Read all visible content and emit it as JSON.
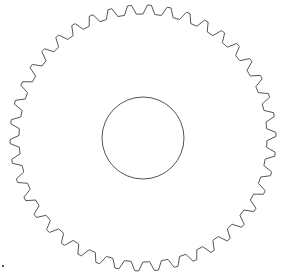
{
  "diagram": {
    "type": "spur-gear-outline",
    "tooth_count": 42,
    "has_center_bore": true,
    "stroke_color": "#555555",
    "background_color": "#ffffff",
    "has_corner_marker": true
  }
}
